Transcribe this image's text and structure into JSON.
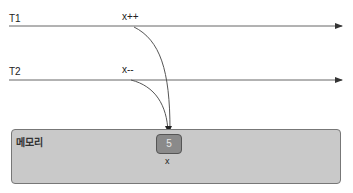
{
  "threads": [
    {
      "label": "T1",
      "operation": "x++"
    },
    {
      "label": "T2",
      "operation": "x--"
    }
  ],
  "memory": {
    "label": "메모리",
    "variable": {
      "name": "x",
      "value": "5"
    }
  },
  "colors": {
    "line": "#555555",
    "memory_fill": "#c9c9c9",
    "cell_fill": "#8a8a8a"
  }
}
